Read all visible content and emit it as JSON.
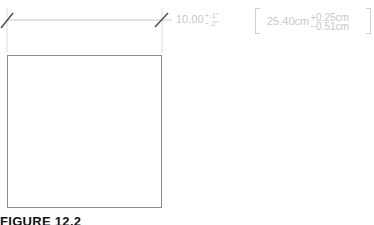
{
  "figure": {
    "caption": "FIGURE 12.2"
  },
  "dimension": {
    "nominal": "10.00",
    "tol_plus": "+.1\"",
    "tol_minus": "−.2\"",
    "metric_nominal": "25.40cm",
    "metric_tol_plus": "+0.25cm",
    "metric_tol_minus": "−0.51cm"
  },
  "colors": {
    "line": "#9a9a9a",
    "extension": "#d8d8d8",
    "text": "#c8c8c8",
    "caption": "#111111"
  }
}
